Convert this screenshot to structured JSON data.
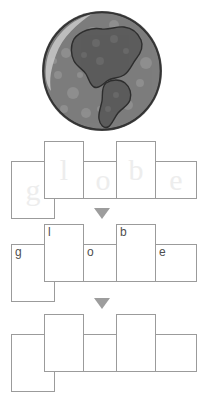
{
  "worksheet": {
    "target_word": "globe",
    "illustration": {
      "name": "globe-illustration",
      "alt_label": "globe",
      "ocean_color": "#7d7d7d",
      "land_color": "#5c5c5c",
      "outline_color": "#2e2e2e",
      "highlight_color": "#b9b9b9"
    },
    "arrows": [
      {
        "name": "step-arrow-1",
        "glyph": "▼",
        "color": "#9d9d9d"
      },
      {
        "name": "step-arrow-2",
        "glyph": "▼",
        "color": "#9d9d9d"
      }
    ],
    "rows": [
      {
        "name": "trace-row",
        "mode": "trace",
        "boxes": [
          {
            "letter": "g",
            "shape": "deep"
          },
          {
            "letter": "l",
            "shape": "tall"
          },
          {
            "letter": "o",
            "shape": "short"
          },
          {
            "letter": "b",
            "shape": "tall"
          },
          {
            "letter": "e",
            "shape": "short"
          }
        ]
      },
      {
        "name": "copy-row",
        "mode": "printed",
        "boxes": [
          {
            "letter": "g",
            "shape": "deep"
          },
          {
            "letter": "l",
            "shape": "tall"
          },
          {
            "letter": "o",
            "shape": "short"
          },
          {
            "letter": "b",
            "shape": "tall"
          },
          {
            "letter": "e",
            "shape": "short"
          }
        ]
      },
      {
        "name": "write-row",
        "mode": "blank",
        "boxes": [
          {
            "letter": "",
            "shape": "deep"
          },
          {
            "letter": "",
            "shape": "tall"
          },
          {
            "letter": "",
            "shape": "short"
          },
          {
            "letter": "",
            "shape": "tall"
          },
          {
            "letter": "",
            "shape": "short"
          }
        ]
      }
    ]
  }
}
